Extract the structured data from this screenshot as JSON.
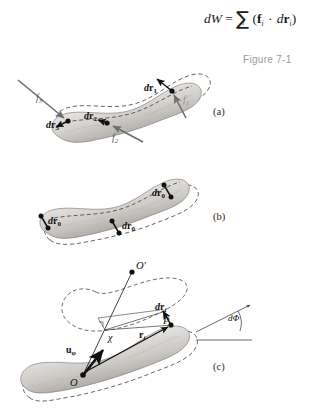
{
  "figure": {
    "caption": "Figure 7-1",
    "equation": {
      "lhs": "dW",
      "equals": "=",
      "sum_symbol": "∑",
      "sum_index": "i",
      "open_paren": "(",
      "force_symbol": "f",
      "force_sub": "i",
      "dot": "·",
      "displacement_d": "d",
      "displacement_symbol": "r",
      "displacement_sub": "i",
      "close_paren": ")",
      "plain_text": "dW = ∑ᵢ (fᵢ · drᵢ)"
    },
    "panels": [
      {
        "id": "a",
        "letter": "(a)",
        "description": "Rigid body translated and rotated; three force vectors with distinct displacements",
        "labels": [
          {
            "name": "dr3",
            "text_d": "d",
            "text_vec": "r",
            "sub": "3",
            "x": 46,
            "y": 120
          },
          {
            "name": "f3",
            "text": "f",
            "sub": "3",
            "x": 36,
            "y": 94
          },
          {
            "name": "dr2",
            "text_d": "d",
            "text_vec": "r",
            "sub": "2",
            "x": 87,
            "y": 112
          },
          {
            "name": "f2",
            "text": "f",
            "sub": "2",
            "x": 113,
            "y": 133
          },
          {
            "name": "dr1",
            "text_d": "d",
            "text_vec": "r",
            "sub": "1",
            "x": 147,
            "y": 84
          },
          {
            "name": "f1",
            "text": "f",
            "sub": "1",
            "x": 183,
            "y": 96
          }
        ]
      },
      {
        "id": "b",
        "letter": "(b)",
        "description": "Pure translation; every point undergoes the same displacement dr0",
        "labels": [
          {
            "name": "dr0-left",
            "text_d": "d",
            "text_vec": "r",
            "sub": "0",
            "x": 48,
            "y": 218
          },
          {
            "name": "dr0-middle",
            "text_d": "d",
            "text_vec": "r",
            "sub": "0",
            "x": 119,
            "y": 220
          },
          {
            "name": "dr0-right",
            "text_d": "d",
            "text_vec": "r",
            "sub": "0",
            "x": 152,
            "y": 188
          }
        ]
      },
      {
        "id": "c",
        "letter": "(c)",
        "description": "Pure rotation about axis through O and O'; point P_i at radius chi sweeps dr_i through angle dPhi",
        "labels": [
          {
            "name": "O-prime",
            "text": "O",
            "prime": "′",
            "x": 134,
            "y": 265
          },
          {
            "name": "dr-i",
            "text_d": "d",
            "text_vec": "r",
            "sub": "i",
            "x": 156,
            "y": 313
          },
          {
            "name": "P-i",
            "text": "P",
            "sub": "i",
            "x": 163,
            "y": 327
          },
          {
            "name": "d-Phi",
            "text": "dΦ",
            "x": 227,
            "y": 316
          },
          {
            "name": "chi",
            "text": "χ",
            "x": 111,
            "y": 338
          },
          {
            "name": "r-i",
            "text_vec": "r",
            "sub": "i",
            "x": 141,
            "y": 334
          },
          {
            "name": "u-phi",
            "text_vec": "u",
            "sub": "φ",
            "x": 70,
            "y": 350
          },
          {
            "name": "O",
            "text": "O",
            "x": 72,
            "y": 382
          }
        ]
      }
    ],
    "colors": {
      "body_light": "#f2f0ee",
      "body_mid": "#c9c6c2",
      "body_dark": "#8e8b87",
      "outline_dashed": "#4a4a4a",
      "arrow_gray": "#6e6e6e",
      "arrow_black": "#111111",
      "caption_gray": "#9b9b9b",
      "text_black": "#111111",
      "background": "#ffffff"
    }
  }
}
